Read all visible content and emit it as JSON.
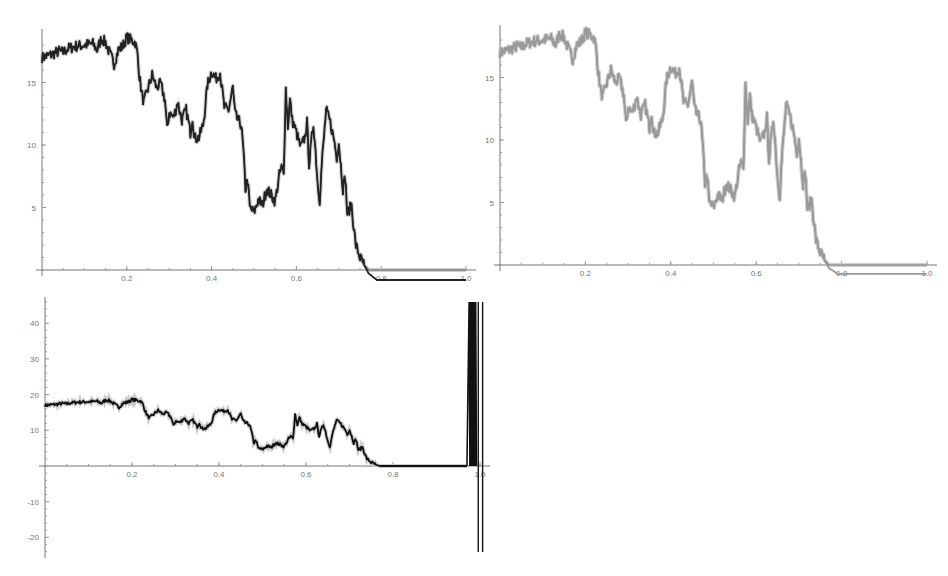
{
  "chart_data": [
    {
      "id": "top-left",
      "type": "line",
      "title": "",
      "xlabel": "",
      "ylabel": "",
      "xlim": [
        0,
        1.0
      ],
      "ylim": [
        -1.5,
        19
      ],
      "grid": false,
      "legend": null,
      "x_ticks": [
        "0.2",
        "0.4",
        "0.6",
        "0.8",
        "1.0"
      ],
      "y_ticks": [
        "5",
        "10",
        "15"
      ],
      "box": {
        "x0": 42,
        "y0": 270,
        "px_per_x": 424,
        "px_per_y": 12.5,
        "top": 29,
        "xaxis_end": 476
      },
      "series": [
        {
          "name": "upper",
          "color": "#555555",
          "width": 1.2,
          "offset_after_0.78": 0.0
        },
        {
          "name": "lower",
          "color": "#222222",
          "width": 1.8,
          "offset_after_0.78": -0.8
        }
      ]
    },
    {
      "id": "top-right",
      "type": "line",
      "title": "",
      "xlabel": "",
      "ylabel": "",
      "xlim": [
        0,
        1.0
      ],
      "ylim": [
        -1.5,
        19
      ],
      "grid": false,
      "legend": null,
      "x_ticks": [
        "0.2",
        "0.4",
        "0.6",
        "0.8",
        "1.0"
      ],
      "y_ticks": [
        "5",
        "10",
        "15"
      ],
      "box": {
        "x0": 500,
        "y0": 265,
        "px_per_x": 427,
        "px_per_y": 12.5,
        "top": 25,
        "xaxis_end": 937
      },
      "series": [
        {
          "name": "upper",
          "color": "#777777",
          "width": 1.2,
          "offset_after_0.78": 0.0
        },
        {
          "name": "lower",
          "color": "#999999",
          "width": 1.8,
          "offset_after_0.78": -0.7
        }
      ]
    },
    {
      "id": "bottom-left",
      "type": "line",
      "title": "",
      "xlabel": "",
      "ylabel": "",
      "xlim": [
        0,
        1.0
      ],
      "ylim": [
        -25,
        47
      ],
      "grid": false,
      "legend": null,
      "x_ticks": [
        "0.2",
        "0.4",
        "0.6",
        "0.8",
        "1.0"
      ],
      "y_ticks": [
        "-20",
        "-10",
        "10",
        "20",
        "30",
        "40"
      ],
      "box": {
        "x0": 45,
        "y0": 466,
        "px_per_x": 435,
        "px_per_y": 3.57,
        "top": 297,
        "bottom": 558,
        "xaxis_end": 490
      },
      "series": [
        {
          "name": "series",
          "color": "#111111",
          "width": 1.8
        }
      ],
      "annotations": [
        {
          "type": "spike",
          "x_values": [
            0.975,
            0.978,
            0.981,
            0.984,
            0.987,
            0.99,
            0.996,
            1.005
          ],
          "note": "vertical spikes near x=1.0 extending beyond the plot range (above 45 and below -23)"
        }
      ]
    }
  ],
  "curve": {
    "x": [
      0,
      0.02,
      0.04,
      0.05,
      0.06,
      0.08,
      0.1,
      0.12,
      0.13,
      0.14,
      0.15,
      0.16,
      0.17,
      0.18,
      0.19,
      0.2,
      0.21,
      0.22,
      0.225,
      0.23,
      0.235,
      0.24,
      0.25,
      0.26,
      0.27,
      0.28,
      0.29,
      0.295,
      0.3,
      0.31,
      0.32,
      0.33,
      0.34,
      0.35,
      0.355,
      0.36,
      0.37,
      0.38,
      0.385,
      0.39,
      0.4,
      0.41,
      0.42,
      0.43,
      0.44,
      0.45,
      0.455,
      0.46,
      0.47,
      0.475,
      0.48,
      0.485,
      0.49,
      0.5,
      0.51,
      0.52,
      0.53,
      0.54,
      0.55,
      0.56,
      0.565,
      0.57,
      0.575,
      0.58,
      0.585,
      0.59,
      0.6,
      0.61,
      0.62,
      0.625,
      0.63,
      0.64,
      0.645,
      0.65,
      0.655,
      0.66,
      0.67,
      0.68,
      0.69,
      0.695,
      0.7,
      0.71,
      0.715,
      0.72,
      0.73,
      0.735,
      0.74,
      0.75,
      0.76,
      0.77,
      0.775,
      0.78,
      0.79,
      0.8,
      0.85,
      0.9,
      0.95,
      1.0
    ],
    "y": [
      17.0,
      17.2,
      17.5,
      17.4,
      17.7,
      17.9,
      18.0,
      18.1,
      17.6,
      18.5,
      18.2,
      17.3,
      16.5,
      17.6,
      17.9,
      18.6,
      18.4,
      18.2,
      17.3,
      15.5,
      14.2,
      13.4,
      14.5,
      15.6,
      14.6,
      14.9,
      13.6,
      11.2,
      12.6,
      12.2,
      13.4,
      12.0,
      12.8,
      11.0,
      12.2,
      10.5,
      10.6,
      11.6,
      13.0,
      14.8,
      15.9,
      15.3,
      15.8,
      13.0,
      12.8,
      14.6,
      12.6,
      12.1,
      11.6,
      9.5,
      6.5,
      7.2,
      5.0,
      4.6,
      5.6,
      5.2,
      6.5,
      6.0,
      5.5,
      7.6,
      8.2,
      7.6,
      14.5,
      11.5,
      13.6,
      12.0,
      11.0,
      9.8,
      10.6,
      11.8,
      8.5,
      11.7,
      9.6,
      7.0,
      5.6,
      8.5,
      12.8,
      11.8,
      10.2,
      9.0,
      10.2,
      6.5,
      7.5,
      4.5,
      5.2,
      3.5,
      2.0,
      1.0,
      0.4,
      0.0,
      0.0,
      0.0,
      0.0,
      0.0,
      0.0,
      0.0,
      0.0,
      0.0
    ]
  }
}
